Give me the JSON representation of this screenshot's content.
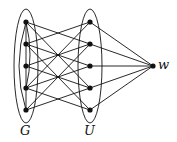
{
  "diagram": {
    "groups": [
      {
        "id": "G",
        "label": "G",
        "cx": 26,
        "cy": 66,
        "rx": 12,
        "ry": 57
      },
      {
        "id": "U",
        "label": "U",
        "cx": 90,
        "cy": 66,
        "rx": 12,
        "ry": 57
      }
    ],
    "nodes": {
      "G": [
        [
          26,
          22
        ],
        [
          26,
          44
        ],
        [
          26,
          66
        ],
        [
          26,
          88
        ],
        [
          26,
          110
        ]
      ],
      "U": [
        [
          90,
          22
        ],
        [
          90,
          44
        ],
        [
          90,
          66
        ],
        [
          90,
          88
        ],
        [
          90,
          110
        ]
      ],
      "w": [
        153,
        66
      ]
    },
    "labels": {
      "G": "G",
      "U": "U",
      "w": "w"
    },
    "stroke_color": "#111111"
  }
}
